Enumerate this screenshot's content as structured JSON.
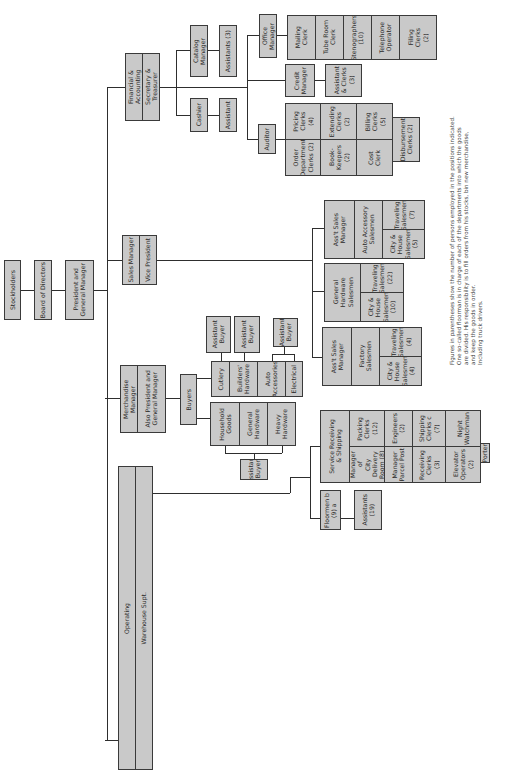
{
  "chart": {
    "orientation": "rotated-90-ccw",
    "box_fill": "#c9c9c9",
    "line_color": "#2e2e2e",
    "top": {
      "stockholders": "Stockholders",
      "board": "Board of Directors",
      "president": "President and\nGeneral Manager"
    },
    "financial": {
      "title": "Financial & Accounting",
      "subtitle": "Secretary & Treasurer",
      "catalog_manager": "Catalog Manager",
      "catalog_assistants": "Assistants (3)",
      "cashier": "Cashier",
      "cashier_assistant": "Assistant",
      "office_manager": "Office Manager",
      "office_staff": [
        "Mailing\nClerk",
        "Tube Room\nClerk",
        "Stenographers\n(10)",
        "Telephone\nOperator",
        "Filing\nClerks\n(2)"
      ],
      "credit_manager": "Credit\nManager",
      "credit_assistants": "Assistant\n& Clerks\n(3)",
      "auditor": "Auditor",
      "auditor_top": [
        "Pricing\nClerks\n(4)",
        "Extending\nClerks\n(2)",
        "Billing\nClerks\n(5)"
      ],
      "auditor_bottom": [
        "Order\nDepartment\nClerks (2)",
        "Book-\nKeepers\n(2)",
        "Cost\nClerk"
      ],
      "disbursement": "Disbursement\nClerks (2)"
    },
    "sales": {
      "title": "Sales Manager",
      "subtitle": "Vice President",
      "group1": {
        "manager": "Ass't Sales\nManager",
        "dept": "Auto Accessory\nSalesmen",
        "traveling": "Traveling\nSalesmen\n(7)",
        "city": "City &\nHouse\nSalesmen\n(5)"
      },
      "group2": {
        "dept": "General\nHardware\nSalesmen",
        "traveling": "Traveling\nSalesmen\n(22)",
        "city": "City &\nHouse\nSalesmen\n(10)"
      },
      "group3": {
        "manager": "Ass't Sales\nManager",
        "dept": "Factory\nSalesmen",
        "traveling": "Traveling\nSalesmen\n(4)",
        "city": "City &\nHouse\nSalesmen\n(4)"
      }
    },
    "merchandise": {
      "title": "Merchandise Manager",
      "subtitle": "Also President and\nGeneral Manager",
      "buyers": "Buyers",
      "upper_depts": [
        "Cutlery",
        "Builders'\nHardware",
        "Auto\nAccessories",
        "Electrical"
      ],
      "upper_assistants": [
        "Assistant\nBuyer",
        "Assistant\nBuyer",
        "Assistant\nBuyer"
      ],
      "lower_depts": [
        "Household\nGoods",
        "General\nHardware",
        "Heavy\nHardware"
      ],
      "lower_assistant": "Assistant\nBuyer"
    },
    "operating": {
      "title": "Operating",
      "subtitle": "Warehouse Supt.",
      "service": "Service Receiving\n& Shipping",
      "service_top": [
        "Packing\nClerks\n(12)",
        "Engineers\n(2)",
        "Shipping\nClerks c\n(7)",
        "Night\nWatchman"
      ],
      "service_bottom": [
        "Manager of\nCity Delivery\nRoom (8)",
        "Manager\nParcel Post",
        "Receiving\nClerks\n(3)",
        "Elevator\nOperators\n(2)"
      ],
      "porter": "Porter",
      "floormen": "Floormen b\n(9) a",
      "floor_assistants": "Assistants\n(19)"
    },
    "footnotes": {
      "a": "Figures in parentheses show the number of persons employed in the positions indicated.",
      "b1": "One so-called floorman is in charge of each of the departments into which the goods",
      "b2": "are divided. His responsibility is to fill orders from his stocks, bin new merchandise,",
      "b3": "and keep the goods in order.",
      "c": "Including truck drivers."
    }
  }
}
